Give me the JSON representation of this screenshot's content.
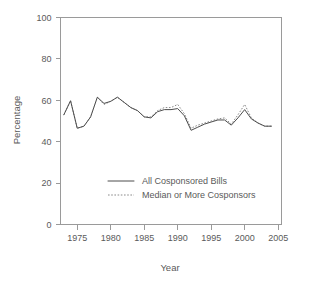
{
  "chart_data": {
    "type": "line",
    "title": "",
    "xlabel": "Year",
    "ylabel": "Percentage",
    "xlim": [
      1972.5,
      2005.5
    ],
    "ylim": [
      0,
      100
    ],
    "xticks": [
      1975,
      1980,
      1985,
      1990,
      1995,
      2000,
      2005
    ],
    "yticks": [
      0,
      20,
      40,
      60,
      80,
      100
    ],
    "grid": false,
    "legend_position": "inside lower-center-left",
    "x": [
      1973,
      1974,
      1975,
      1976,
      1977,
      1978,
      1979,
      1980,
      1981,
      1982,
      1983,
      1984,
      1985,
      1986,
      1987,
      1988,
      1989,
      1990,
      1991,
      1992,
      1993,
      1994,
      1995,
      1996,
      1997,
      1998,
      1999,
      2000,
      2001,
      2002,
      2003,
      2004
    ],
    "series": [
      {
        "name": "All Cosponsored Bills",
        "style": "solid",
        "color": "#4d4d4d",
        "values": [
          53.0,
          59.8,
          46.5,
          47.5,
          52.0,
          61.5,
          58.5,
          59.5,
          61.5,
          59.0,
          56.5,
          55.0,
          52.0,
          51.5,
          54.5,
          55.5,
          55.5,
          56.0,
          52.5,
          45.5,
          47.0,
          48.5,
          49.5,
          50.5,
          50.5,
          48.0,
          51.5,
          55.5,
          51.0,
          49.0,
          47.5,
          47.5
        ]
      },
      {
        "name": "Median or More Cosponsors",
        "style": "dotted",
        "color": "#8a8a8a",
        "values": [
          53.0,
          59.8,
          46.5,
          47.5,
          52.0,
          61.5,
          58.0,
          59.5,
          61.5,
          59.0,
          56.5,
          55.0,
          52.0,
          52.0,
          55.0,
          56.5,
          56.5,
          58.0,
          53.5,
          46.5,
          48.0,
          49.0,
          50.0,
          51.0,
          51.5,
          48.5,
          53.0,
          58.0,
          51.5,
          49.0,
          47.5,
          47.5
        ]
      }
    ],
    "axis_color": "#9a9a9a",
    "text_color": "#5a5a5a"
  },
  "legend": {
    "entries": [
      {
        "label": "All Cosponsored Bills"
      },
      {
        "label": "Median or More Cosponsors"
      }
    ]
  },
  "ticks": {
    "x_labels": [
      "1975",
      "1980",
      "1985",
      "1990",
      "1995",
      "2000",
      "2005"
    ],
    "y_labels": [
      "0",
      "20",
      "40",
      "60",
      "80",
      "100"
    ]
  },
  "labels": {
    "xlabel": "Year",
    "ylabel": "Percentage"
  }
}
